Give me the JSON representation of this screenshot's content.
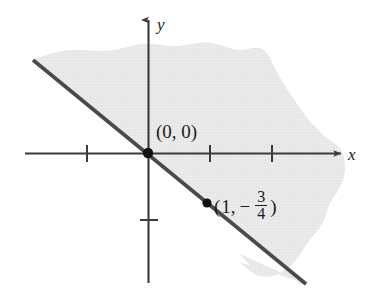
{
  "figure": {
    "background_color": "#ffffff",
    "width": 370,
    "height": 295
  },
  "axes": {
    "x_label": "x",
    "y_label": "y",
    "axis_color": "#3a3a3a",
    "origin_px": {
      "x": 148,
      "y": 153
    },
    "x_axis": {
      "start_px": 25,
      "end_px": 341,
      "tick_positions_px": [
        87,
        210,
        272
      ],
      "tick_labels": [
        "",
        "",
        ""
      ],
      "arrow": "right"
    },
    "y_axis": {
      "start_px": 20,
      "end_px": 283,
      "tick_positions_px": [
        220
      ],
      "tick_labels": [
        ""
      ],
      "arrow": "up"
    },
    "unit_px": 62
  },
  "boundary_line": {
    "color": "#4a4a4a",
    "width_px": 3.6,
    "style": "solid",
    "start_px": {
      "x": 33,
      "y": 60
    },
    "end_px": {
      "x": 306,
      "y": 284
    },
    "slope": -0.75,
    "y_intercept": 0,
    "equation": "y = -3/4 x"
  },
  "shaded_region": {
    "fill_color": "#e7e7e7",
    "description": "half-plane above the line, hand-drawn irregular outer boundary",
    "side": "above"
  },
  "points": [
    {
      "name": "origin-point",
      "label": "(0, 0)",
      "label_parts": {
        "open": "(",
        "x": "0,",
        "y": "0",
        "close": ")"
      },
      "dot_px": {
        "x": 148,
        "y": 153
      },
      "dot_radius_px": 5.2,
      "dot_color": "#121212",
      "label_px": {
        "x": 156,
        "y": 122
      }
    },
    {
      "name": "point-one-neg-three-quarters",
      "label": "(1, -3/4)",
      "label_parts": {
        "open": "(",
        "x": "1,",
        "minus": "−",
        "num": "3",
        "den": "4",
        "close": ")"
      },
      "dot_px": {
        "x": 207,
        "y": 203
      },
      "dot_radius_px": 4.6,
      "dot_color": "#121212",
      "label_px": {
        "x": 214,
        "y": 190
      }
    }
  ]
}
